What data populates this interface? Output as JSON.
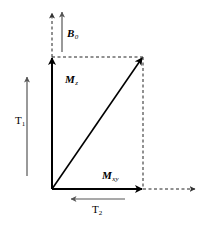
{
  "diagram": {
    "type": "vector-decomposition",
    "labels": {
      "b0": {
        "main": "B",
        "sub": "0"
      },
      "mz": {
        "main": "M",
        "sub": "z"
      },
      "mxy": {
        "main": "M",
        "sub": "xy"
      },
      "t1": {
        "main": "T",
        "sub": "1"
      },
      "t2": {
        "main": "T",
        "sub": "2"
      }
    },
    "colors": {
      "main_vector": "#000000",
      "guide_arrow": "#555555",
      "dashed": "#222222"
    }
  }
}
